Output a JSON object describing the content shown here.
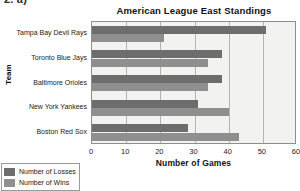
{
  "exercise": {
    "label": "2. a)"
  },
  "chart_data": {
    "type": "bar",
    "orientation": "horizontal",
    "title": "American League East Standings",
    "xlabel": "Number of Games",
    "ylabel": "Team",
    "xlim": [
      0,
      60
    ],
    "xticks": [
      0,
      10,
      20,
      30,
      40,
      50,
      60
    ],
    "xtick_labels": [
      "0",
      "10",
      "20",
      "30",
      "40",
      "50",
      "60"
    ],
    "grid": true,
    "grid_axis": "x",
    "legend_position": "bottom-left",
    "categories": [
      "Tampa Bay Devil Rays",
      "Toronto Blue Jays",
      "Baltimore Orioles",
      "New York Yankees",
      "Boston Red Sox"
    ],
    "series": [
      {
        "name": "Number of Losses",
        "color": "#6d6d6d",
        "values": [
          51,
          38,
          38,
          31,
          28
        ]
      },
      {
        "name": "Number of Wins",
        "color": "#8f8f8f",
        "values": [
          21,
          34,
          34,
          40,
          43
        ]
      }
    ]
  },
  "colors": {
    "losses": "#6d6d6d",
    "wins": "#8f8f8f",
    "plot_background": "#f2f2f0",
    "plot_border": "#8e8e8e",
    "gridline": "#b3b3b3"
  }
}
